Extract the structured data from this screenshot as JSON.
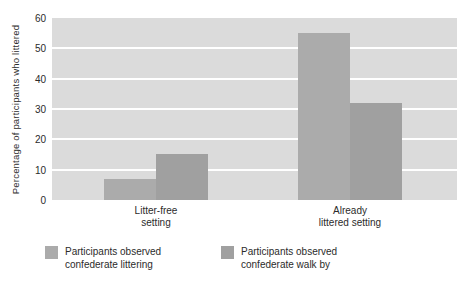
{
  "chart_data": {
    "type": "bar",
    "title": "",
    "xlabel": "",
    "ylabel": "Percentage of participants who littered",
    "categories": [
      "Litter-free\nsetting",
      "Already\nlittered setting"
    ],
    "series": [
      {
        "name": "Participants observed confederate littering",
        "values": [
          7,
          55
        ],
        "color": "#ababab"
      },
      {
        "name": "Participants observed confederate walk by",
        "values": [
          15,
          32
        ],
        "color": "#a0a0a0"
      }
    ],
    "ylim": [
      0,
      60
    ],
    "yticks": [
      0,
      10,
      20,
      30,
      40,
      50,
      60
    ],
    "grid": "horizontal",
    "legend_position": "bottom-left"
  },
  "colors": {
    "plot_background": "#dbdbdb",
    "gridline": "#ffffff",
    "text": "#2b2b2b",
    "page_background": "#ffffff"
  }
}
